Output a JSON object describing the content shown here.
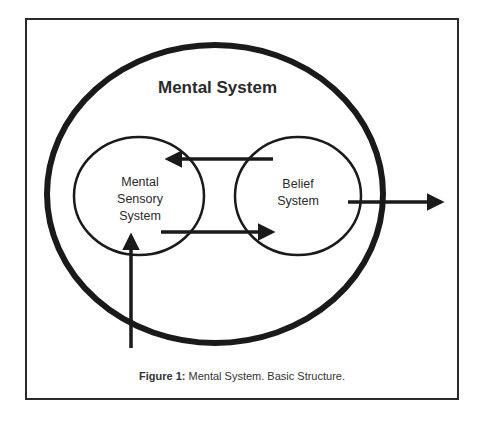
{
  "diagram": {
    "title": "Mental System",
    "nodes": [
      {
        "id": "mental-sensory-system",
        "lines": [
          "Mental",
          "Sensory",
          "System"
        ]
      },
      {
        "id": "belief-system",
        "lines": [
          "Belief",
          "System"
        ]
      }
    ],
    "edges": [
      {
        "from": "external-input",
        "to": "mental-sensory-system",
        "direction": "up"
      },
      {
        "from": "mental-sensory-system",
        "to": "belief-system",
        "direction": "right"
      },
      {
        "from": "belief-system",
        "to": "mental-sensory-system",
        "direction": "left"
      },
      {
        "from": "belief-system",
        "to": "external-output",
        "direction": "right"
      }
    ],
    "colors": {
      "stroke": "#1a1a1a",
      "frame": "#2a2a2a",
      "background": "#ffffff"
    }
  },
  "caption": {
    "label": "Figure 1:",
    "text": " Mental System. Basic Structure."
  }
}
